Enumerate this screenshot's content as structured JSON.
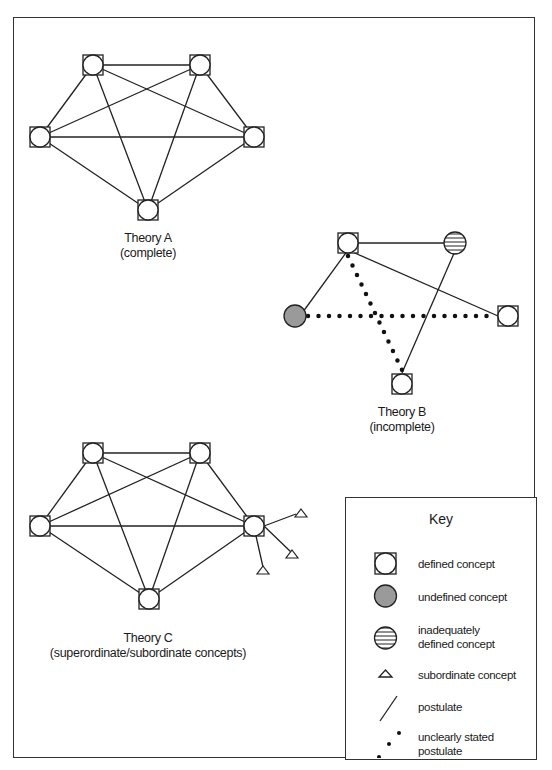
{
  "theories": [
    {
      "title": "Theory A",
      "subtitle": "(complete)"
    },
    {
      "title": "Theory B",
      "subtitle": "(incomplete)"
    },
    {
      "title": "Theory C",
      "subtitle": "(superordinate/subordinate concepts)"
    }
  ],
  "key": {
    "title": "Key",
    "items": [
      {
        "symbol": "square-circle-icon",
        "label": "defined concept"
      },
      {
        "symbol": "gray-circle-icon",
        "label": "undefined concept"
      },
      {
        "symbol": "striped-circle-icon",
        "label": "inadequately defined concept"
      },
      {
        "symbol": "triangle-icon",
        "label": "subordinate concept"
      },
      {
        "symbol": "solid-line-icon",
        "label": "postulate"
      },
      {
        "symbol": "dotted-line-icon",
        "label": "unclearly stated postulate"
      }
    ]
  },
  "colors": {
    "line": "#222222",
    "undefined_fill": "#9a9a9a",
    "border": "#333333"
  }
}
